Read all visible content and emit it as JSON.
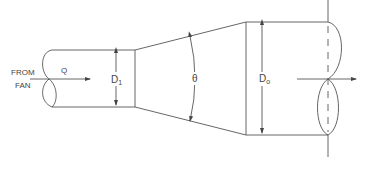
{
  "diagram": {
    "labels": {
      "source_line1": "FROM",
      "source_line2": "FAN",
      "flow": "Q",
      "inlet_diameter_main": "D",
      "inlet_diameter_sub": "1",
      "angle": "θ",
      "outlet_diameter_main": "D",
      "outlet_diameter_sub": "o"
    },
    "colors": {
      "line": "#555555",
      "text": "#444444",
      "background": "#ffffff"
    }
  }
}
